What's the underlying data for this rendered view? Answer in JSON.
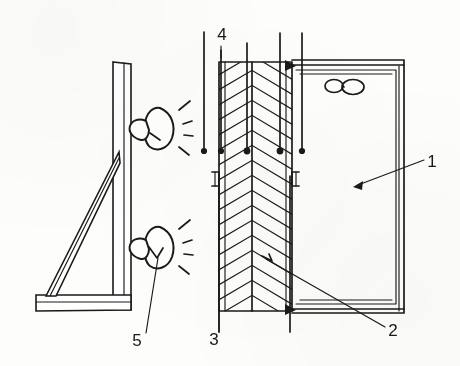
{
  "figure": {
    "kind": "technical-line-drawing",
    "style": "scanned patent figure, black ink on white paper",
    "width": 460,
    "height": 366,
    "background_color": "#fdfdfc",
    "ink_color": "#1c1a18"
  },
  "callouts": [
    {
      "id": "1",
      "label": "1",
      "text_x": 432,
      "text_y": 167,
      "leader": {
        "from_x": 424,
        "from_y": 160,
        "to_x": 356,
        "to_y": 186
      },
      "arrow": "filled-triangle-at-target",
      "points_to": "enclosure-interior-panel"
    },
    {
      "id": "2",
      "label": "2",
      "text_x": 393,
      "text_y": 336,
      "leader": {
        "from_x": 385,
        "from_y": 327,
        "to_x": 266,
        "to_y": 259
      },
      "arrow": "plain",
      "points_to": "column-core-marker"
    },
    {
      "id": "3",
      "label": "3",
      "text_x": 214,
      "text_y": 345,
      "leader": {
        "from_x": 219,
        "from_y": 332,
        "to_x": 219,
        "to_y": 305
      },
      "arrow": "plain",
      "points_to": "left-side-rail"
    },
    {
      "id": "4",
      "label": "4",
      "text_x": 222,
      "text_y": 40,
      "leader": {
        "from_x": 221,
        "from_y": 44,
        "to_x": 221,
        "to_y": 58
      },
      "arrow": "plain",
      "points_to": "upper-vertical-rod"
    },
    {
      "id": "5",
      "label": "5",
      "text_x": 137,
      "text_y": 346,
      "leader": {
        "from_x": 146,
        "from_y": 333,
        "to_x": 158,
        "to_y": 258
      },
      "arrow": "plain",
      "points_to": "lower-lamp"
    }
  ],
  "bracket": {
    "name": "L-shaped support bracket",
    "post": {
      "label": "vertical-post",
      "x1": 113,
      "y1": 62,
      "x2": 131,
      "y2": 310
    },
    "base": {
      "label": "horizontal-base",
      "x1": 36,
      "y1": 295,
      "x2": 131,
      "y2": 310
    },
    "brace": {
      "label": "diagonal-brace",
      "from_x": 46,
      "from_y": 297,
      "to_x": 120,
      "to_y": 152
    }
  },
  "lamps": [
    {
      "id": "lamp-upper",
      "label": "upper spotlight",
      "cx": 155,
      "cy": 128,
      "ray_count": 4,
      "aim": "right"
    },
    {
      "id": "lamp-lower",
      "label": "lower spotlight",
      "cx": 155,
      "cy": 247,
      "ray_count": 4,
      "aim": "right"
    }
  ],
  "column": {
    "name": "hatched core column",
    "hatch_pattern": "herringbone-chevron",
    "left_edge_x": 219,
    "right_edge_x": 292,
    "center_x": 252,
    "top_y": 62,
    "bottom_y": 311,
    "chevron_count": 17,
    "clips": [
      {
        "side": "left",
        "x": 216,
        "y": 178
      },
      {
        "side": "right",
        "x": 290,
        "y": 178
      }
    ]
  },
  "rods": {
    "name": "vertical suspension rods with bead terminations",
    "bead_y": 150,
    "items": [
      {
        "id": "rod-1",
        "x": 204,
        "top_y": 32,
        "bead": true
      },
      {
        "id": "rod-2",
        "x": 221,
        "top_y": 50,
        "bead": true
      },
      {
        "id": "rod-3",
        "x": 247,
        "top_y": 43,
        "bead": true
      },
      {
        "id": "rod-4",
        "x": 280,
        "top_y": 33,
        "bead": true
      },
      {
        "id": "rod-5",
        "x": 302,
        "top_y": 33,
        "bead": true
      }
    ],
    "lower_rails": [
      {
        "id": "rail-left",
        "x": 219,
        "top_y": 176,
        "bottom_y": 332
      },
      {
        "id": "rail-right",
        "x": 290,
        "top_y": 176,
        "bottom_y": 332
      }
    ]
  },
  "enclosure": {
    "name": "right-hand chamber frame",
    "outer": {
      "x": 292,
      "y": 60,
      "w": 112,
      "h": 253
    },
    "inner": {
      "x": 296,
      "y": 70,
      "w": 100,
      "h": 234
    },
    "fan": {
      "id": "fan-propeller",
      "cx": 344,
      "cy": 85,
      "blades": 2,
      "label": "two-blade propeller fan"
    }
  },
  "joints": [
    {
      "id": "joint-top",
      "x": 292,
      "y": 65,
      "style": "filled-node"
    },
    {
      "id": "joint-bottom",
      "x": 292,
      "y": 309,
      "style": "filled-node"
    }
  ],
  "marker": {
    "id": "column-core-marker",
    "x": 266,
    "y": 259,
    "label": "small internal arrow marker"
  }
}
